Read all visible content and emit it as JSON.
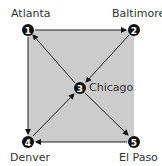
{
  "diagram": {
    "background_fill": "#cccccc",
    "nodes": [
      {
        "id": "1",
        "label": "Atlanta",
        "x": 28,
        "y": 30
      },
      {
        "id": "2",
        "label": "Baltimore",
        "x": 134,
        "y": 30
      },
      {
        "id": "3",
        "label": "Chicago",
        "x": 80,
        "y": 88
      },
      {
        "id": "4",
        "label": "Denver",
        "x": 28,
        "y": 142
      },
      {
        "id": "5",
        "label": "El Paso",
        "x": 134,
        "y": 142
      }
    ],
    "edges": [
      {
        "from": "1",
        "to": "2"
      },
      {
        "from": "2",
        "to": "3"
      },
      {
        "from": "3",
        "to": "1"
      },
      {
        "from": "3",
        "to": "5"
      },
      {
        "from": "5",
        "to": "4"
      },
      {
        "from": "4",
        "to": "3"
      },
      {
        "from": "1",
        "to": "4"
      }
    ]
  }
}
